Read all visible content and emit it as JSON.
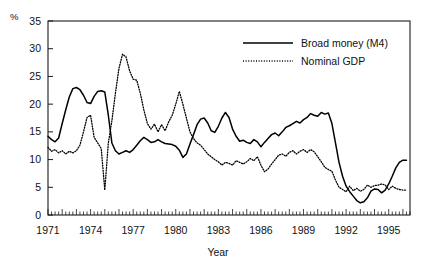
{
  "chart_data": {
    "type": "line",
    "title": "",
    "xlabel": "Year",
    "ylabel": "",
    "unit_label": "%",
    "xlim": [
      1971.0,
      1996.5
    ],
    "ylim": [
      0,
      35
    ],
    "y_ticks": [
      0,
      5,
      10,
      15,
      20,
      25,
      30,
      35
    ],
    "x_ticks": [
      1971,
      1974,
      1977,
      1980,
      1983,
      1986,
      1989,
      1992,
      1995
    ],
    "x_tick_labels": [
      "1971",
      "1974",
      "1977",
      "1980",
      "1983",
      "1986",
      "1989",
      "1992",
      "1995"
    ],
    "y_tick_labels": [
      "0",
      "5",
      "10",
      "15",
      "20",
      "25",
      "30",
      "35"
    ],
    "x_minor_interval": 0.25,
    "grid": false,
    "legend_position": "top-right",
    "frame": "box",
    "series": [
      {
        "name": "Broad money (M4)",
        "style": "solid",
        "color": "#000000",
        "x": [
          1971.0,
          1971.25,
          1971.5,
          1971.75,
          1972.0,
          1972.25,
          1972.5,
          1972.75,
          1973.0,
          1973.25,
          1973.5,
          1973.75,
          1974.0,
          1974.25,
          1974.5,
          1974.75,
          1975.0,
          1975.25,
          1975.5,
          1975.75,
          1976.0,
          1976.25,
          1976.5,
          1976.75,
          1977.0,
          1977.25,
          1977.5,
          1977.75,
          1978.0,
          1978.25,
          1978.5,
          1978.75,
          1979.0,
          1979.25,
          1979.5,
          1979.75,
          1980.0,
          1980.25,
          1980.5,
          1980.75,
          1981.0,
          1981.25,
          1981.5,
          1981.75,
          1982.0,
          1982.25,
          1982.5,
          1982.75,
          1983.0,
          1983.25,
          1983.5,
          1983.75,
          1984.0,
          1984.25,
          1984.5,
          1984.75,
          1985.0,
          1985.25,
          1985.5,
          1985.75,
          1986.0,
          1986.25,
          1986.5,
          1986.75,
          1987.0,
          1987.25,
          1987.5,
          1987.75,
          1988.0,
          1988.25,
          1988.5,
          1988.75,
          1989.0,
          1989.25,
          1989.5,
          1989.75,
          1990.0,
          1990.25,
          1990.5,
          1990.75,
          1991.0,
          1991.25,
          1991.5,
          1991.75,
          1992.0,
          1992.25,
          1992.5,
          1992.75,
          1993.0,
          1993.25,
          1993.5,
          1993.75,
          1994.0,
          1994.25,
          1994.5,
          1994.75,
          1995.0,
          1995.25,
          1995.5,
          1995.75,
          1996.0,
          1996.25
        ],
        "values": [
          14.2,
          13.6,
          13.2,
          13.9,
          16.5,
          19.0,
          21.3,
          22.8,
          23.0,
          22.6,
          21.6,
          20.3,
          20.1,
          21.4,
          22.3,
          22.4,
          22.2,
          18.0,
          13.0,
          11.6,
          11.0,
          11.3,
          11.6,
          11.3,
          11.8,
          12.6,
          13.4,
          14.0,
          13.6,
          13.1,
          13.2,
          13.6,
          13.2,
          12.9,
          12.8,
          12.7,
          12.4,
          11.7,
          10.4,
          11.0,
          12.8,
          14.5,
          16.3,
          17.3,
          17.5,
          16.6,
          15.2,
          14.9,
          16.0,
          17.5,
          18.5,
          17.6,
          15.5,
          14.2,
          13.3,
          13.5,
          13.1,
          12.9,
          13.6,
          13.2,
          12.3,
          13.1,
          13.8,
          14.5,
          14.8,
          14.3,
          15.0,
          15.8,
          16.1,
          16.5,
          16.9,
          16.6,
          17.2,
          17.6,
          18.3,
          18.0,
          17.8,
          18.5,
          18.2,
          18.4,
          16.5,
          13.0,
          9.5,
          7.0,
          5.2,
          4.2,
          3.4,
          2.6,
          2.2,
          2.4,
          3.1,
          4.3,
          4.7,
          4.6,
          4.0,
          4.5,
          5.6,
          7.0,
          8.5,
          9.5,
          9.9,
          9.9
        ]
      },
      {
        "name": "Nominal GDP",
        "style": "dotted",
        "color": "#000000",
        "x": [
          1971.0,
          1971.25,
          1971.5,
          1971.75,
          1972.0,
          1972.25,
          1972.5,
          1972.75,
          1973.0,
          1973.25,
          1973.5,
          1973.75,
          1974.0,
          1974.25,
          1974.5,
          1974.75,
          1975.0,
          1975.25,
          1975.5,
          1975.75,
          1976.0,
          1976.25,
          1976.5,
          1976.75,
          1977.0,
          1977.25,
          1977.5,
          1977.75,
          1978.0,
          1978.25,
          1978.5,
          1978.75,
          1979.0,
          1979.25,
          1979.5,
          1979.75,
          1980.0,
          1980.25,
          1980.5,
          1980.75,
          1981.0,
          1981.25,
          1981.5,
          1981.75,
          1982.0,
          1982.25,
          1982.5,
          1982.75,
          1983.0,
          1983.25,
          1983.5,
          1983.75,
          1984.0,
          1984.25,
          1984.5,
          1984.75,
          1985.0,
          1985.25,
          1985.5,
          1985.75,
          1986.0,
          1986.25,
          1986.5,
          1986.75,
          1987.0,
          1987.25,
          1987.5,
          1987.75,
          1988.0,
          1988.25,
          1988.5,
          1988.75,
          1989.0,
          1989.25,
          1989.5,
          1989.75,
          1990.0,
          1990.25,
          1990.5,
          1990.75,
          1991.0,
          1991.25,
          1991.5,
          1991.75,
          1992.0,
          1992.25,
          1992.5,
          1992.75,
          1993.0,
          1993.25,
          1993.5,
          1993.75,
          1994.0,
          1994.25,
          1994.5,
          1994.75,
          1995.0,
          1995.25,
          1995.5,
          1995.75,
          1996.0,
          1996.25
        ],
        "values": [
          12.2,
          11.5,
          11.8,
          11.2,
          11.6,
          11.0,
          11.5,
          11.2,
          11.6,
          12.6,
          15.0,
          17.6,
          18.0,
          14.0,
          13.0,
          12.0,
          4.5,
          13.0,
          17.0,
          22.0,
          26.5,
          29.0,
          28.5,
          26.0,
          24.5,
          24.3,
          22.0,
          19.0,
          16.5,
          15.5,
          16.4,
          15.0,
          16.3,
          15.2,
          16.8,
          18.0,
          20.0,
          22.3,
          20.0,
          17.5,
          15.0,
          13.8,
          13.0,
          12.6,
          11.8,
          11.0,
          10.5,
          10.0,
          9.6,
          9.0,
          9.5,
          9.3,
          9.0,
          9.8,
          9.5,
          9.2,
          9.6,
          10.2,
          9.8,
          10.5,
          9.0,
          7.8,
          8.3,
          9.2,
          10.0,
          10.8,
          11.0,
          10.6,
          11.3,
          11.6,
          11.0,
          11.5,
          11.8,
          11.3,
          11.8,
          11.4,
          10.5,
          9.6,
          8.6,
          8.2,
          7.9,
          6.3,
          5.0,
          4.6,
          4.2,
          5.2,
          4.4,
          4.8,
          4.3,
          4.6,
          5.4,
          5.0,
          5.3,
          5.4,
          5.6,
          5.4,
          4.6,
          5.2,
          4.8,
          4.6,
          4.5,
          4.5
        ]
      }
    ]
  },
  "legend": {
    "items": [
      {
        "label": "Broad money (M4)",
        "style": "solid"
      },
      {
        "label": "Nominal GDP",
        "style": "dotted"
      }
    ]
  },
  "axes": {
    "unit_label": "%",
    "x_title": "Year"
  }
}
